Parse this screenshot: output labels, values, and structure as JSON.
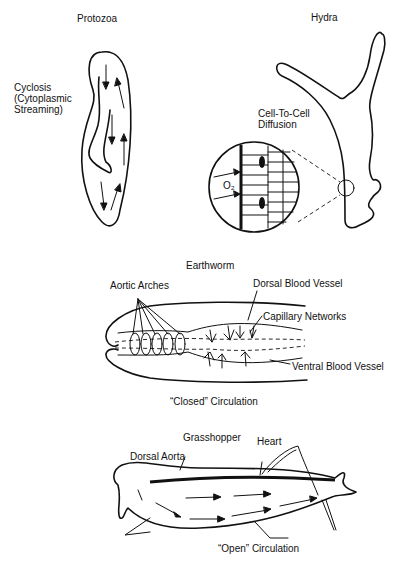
{
  "panels": {
    "protozoa": {
      "title": "Protozoa",
      "label_lines": [
        "Cyclosis",
        "(Cytoplasmic",
        "Streaming)"
      ]
    },
    "hydra": {
      "title": "Hydra",
      "label_lines": [
        "Cell-To-Cell",
        "Diffusion"
      ],
      "inset_label": "O₂"
    },
    "earthworm": {
      "title": "Earthworm",
      "labels": {
        "aortic_arches": "Aortic Arches",
        "dorsal_vessel": "Dorsal Blood Vessel",
        "capillary": "Capillary Networks",
        "ventral_vessel": "Ventral Blood Vessel"
      },
      "caption": "“Closed” Circulation"
    },
    "grasshopper": {
      "title": "Grasshopper",
      "labels": {
        "dorsal_aorta": "Dorsal Aorta",
        "heart": "Heart"
      },
      "caption": "“Open” Circulation"
    }
  },
  "colors": {
    "ink": "#111111",
    "background": "#ffffff"
  }
}
